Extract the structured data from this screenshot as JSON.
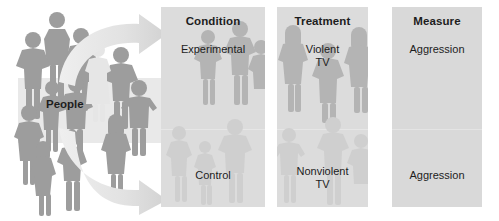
{
  "diagram": {
    "type": "experimental-design-flowchart",
    "crowd_label": "People",
    "colors": {
      "panel_background": "#dcdcdc",
      "measure_panel_background": "#d9d9d9",
      "silhouette_dark": "#9a9a9a",
      "silhouette_light": "#cfcfcf",
      "arrow_fill": "#e3e3e3",
      "text": "#1d1d1d",
      "page_background": "#ffffff"
    },
    "panels": [
      {
        "id": "condition",
        "title": "Condition",
        "upper_label": "Experimental",
        "lower_label": "Control"
      },
      {
        "id": "treatment",
        "title": "Treatment",
        "upper_label": "Violent\nTV",
        "lower_label": "Nonviolent\nTV"
      },
      {
        "id": "measure",
        "title": "Measure",
        "upper_label": "Aggression",
        "lower_label": "Aggression"
      }
    ],
    "arrows": [
      {
        "id": "arrow-to-experimental",
        "direction": "right",
        "shape": "curved",
        "target": "Experimental"
      },
      {
        "id": "arrow-to-control",
        "direction": "right",
        "shape": "curved",
        "target": "Control"
      }
    ]
  }
}
